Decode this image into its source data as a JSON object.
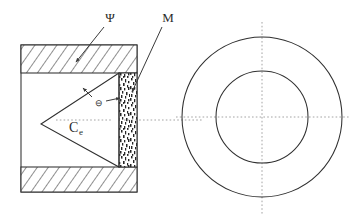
{
  "figure": {
    "labels": {
      "psi": "Ψ",
      "m": "M",
      "ce_main": "C",
      "ce_sub": "e",
      "electron": "⊖"
    },
    "annotations": [
      {
        "name": "psi-label",
        "text": "Ψ",
        "x": 108,
        "y": 21,
        "leader_from": [
          104,
          26
        ],
        "leader_to": [
          74,
          62
        ],
        "target": "upper-hatched-band"
      },
      {
        "name": "m-label",
        "text": "M",
        "x": 166,
        "y": 21,
        "leader_from": [
          162,
          26
        ],
        "leader_to": [
          134,
          86
        ],
        "target": "stippled-band"
      },
      {
        "name": "ce-label",
        "text": "Ce",
        "x": 76,
        "y": 130,
        "target": "cone-interior"
      },
      {
        "name": "electron-symbol",
        "text": "⊖",
        "x": 99,
        "y": 103,
        "arrow_from": [
          106,
          100
        ],
        "arrow_to": [
          121,
          97
        ],
        "target": "stippled-band"
      }
    ],
    "left_view": {
      "name": "cross-section-view",
      "body_rect": {
        "x": 21,
        "y": 45,
        "width": 116,
        "height": 147
      },
      "upper_hatch_band": {
        "x": 21,
        "y": 45,
        "width": 116,
        "height": 28,
        "pattern": "diagonal-hatch"
      },
      "lower_hatch_band": {
        "x": 21,
        "y": 167,
        "width": 116,
        "height": 25,
        "pattern": "diagonal-hatch"
      },
      "stippled_band": {
        "x": 119,
        "y": 73,
        "width": 18,
        "height": 94,
        "pattern": "stipple"
      },
      "cone": {
        "apex": [
          41,
          124
        ],
        "top": [
          119,
          73
        ],
        "bottom": [
          119,
          167
        ]
      },
      "centerline_y": 120
    },
    "right_view": {
      "name": "end-view",
      "center": [
        262,
        117
      ],
      "outer_radius": 80,
      "inner_radius": 46,
      "centerline_v_x": 262,
      "centerline_h_y": 117
    }
  }
}
